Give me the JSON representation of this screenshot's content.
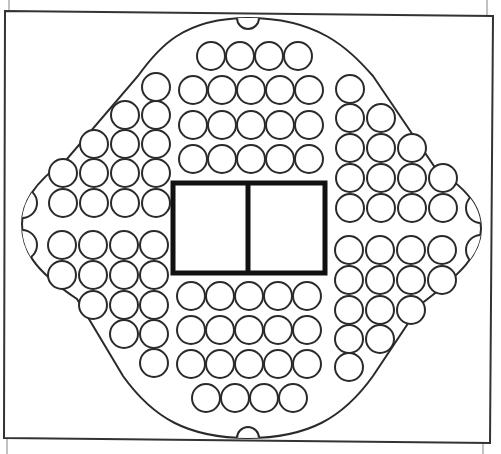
{
  "game": {
    "title": "Peg board game board",
    "colors": {
      "line": "#2a2a2a",
      "center_box": "#111111",
      "background": "#ffffff",
      "frame": "#333333",
      "tick": "#999999"
    },
    "frame": {
      "points": [
        [
          5,
          11
        ],
        [
          493,
          16
        ],
        [
          490,
          443
        ],
        [
          4,
          438
        ]
      ]
    },
    "ticks": [
      {
        "x1": 9,
        "y1": 0,
        "x2": 9,
        "y2": 11
      },
      {
        "x1": 487,
        "y1": 0,
        "x2": 487,
        "y2": 16
      },
      {
        "x1": 7,
        "y1": 438,
        "x2": 7,
        "y2": 454
      },
      {
        "x1": 483,
        "y1": 443,
        "x2": 483,
        "y2": 454
      }
    ],
    "board_outline": {
      "top": [
        248,
        18
      ],
      "right": [
        481,
        229
      ],
      "bottom": [
        248,
        438
      ],
      "left": [
        22,
        224
      ]
    },
    "center_box": {
      "x": 173,
      "y": 183,
      "width": 152,
      "height": 90,
      "divider_x": 248,
      "compartments": [
        "left-compartment",
        "right-compartment"
      ]
    },
    "hole_radius": 14,
    "half_holes": [
      {
        "id": "top",
        "cx": 248,
        "cy": 18,
        "r": 11,
        "side": "top"
      },
      {
        "id": "bottom",
        "cx": 248,
        "cy": 438,
        "r": 11,
        "side": "bottom"
      },
      {
        "id": "left-upper",
        "cx": 22,
        "cy": 203,
        "r": 15,
        "side": "left"
      },
      {
        "id": "left-lower",
        "cx": 22,
        "cy": 245,
        "r": 15,
        "side": "left"
      },
      {
        "id": "right-upper",
        "cx": 481,
        "cy": 208,
        "r": 15,
        "side": "right"
      },
      {
        "id": "right-lower",
        "cx": 481,
        "cy": 250,
        "r": 15,
        "side": "right"
      }
    ],
    "regions": {
      "top": {
        "rows": [
          {
            "y": 56,
            "xs": [
              211,
              240,
              269,
              298
            ]
          },
          {
            "y": 90,
            "xs": [
              193,
              222,
              251,
              280,
              309
            ]
          },
          {
            "y": 125,
            "xs": [
              193,
              222,
              251,
              280,
              309
            ]
          },
          {
            "y": 159,
            "xs": [
              193,
              222,
              251,
              280,
              309
            ]
          }
        ]
      },
      "bottom": {
        "rows": [
          {
            "y": 296,
            "xs": [
              191,
              220,
              249,
              278,
              307
            ]
          },
          {
            "y": 330,
            "xs": [
              191,
              220,
              249,
              278,
              307
            ]
          },
          {
            "y": 364,
            "xs": [
              191,
              220,
              249,
              278,
              307
            ]
          },
          {
            "y": 398,
            "xs": [
              206,
              235,
              264,
              293
            ]
          }
        ]
      },
      "left_upper": {
        "cols": [
          {
            "x": 156,
            "ys": [
              87,
              115,
              144,
              173,
              203
            ]
          },
          {
            "x": 125,
            "ys": [
              115,
              144,
              173,
              203
            ]
          },
          {
            "x": 94,
            "ys": [
              144,
              173,
              203
            ]
          },
          {
            "x": 63,
            "ys": [
              173,
              203
            ]
          }
        ]
      },
      "left_lower": {
        "cols": [
          {
            "x": 154,
            "ys": [
              245,
              275,
              305,
              334,
              363
            ]
          },
          {
            "x": 124,
            "ys": [
              245,
              275,
              305,
              334
            ]
          },
          {
            "x": 93,
            "ys": [
              245,
              275,
              305
            ]
          },
          {
            "x": 62,
            "ys": [
              245,
              275
            ]
          }
        ]
      },
      "right_upper": {
        "cols": [
          {
            "x": 350,
            "ys": [
              89,
              118,
              148,
              178,
              208
            ]
          },
          {
            "x": 381,
            "ys": [
              118,
              148,
              178,
              208
            ]
          },
          {
            "x": 412,
            "ys": [
              148,
              178,
              208
            ]
          },
          {
            "x": 443,
            "ys": [
              178,
              208
            ]
          }
        ]
      },
      "right_lower": {
        "cols": [
          {
            "x": 349,
            "ys": [
              250,
              280,
              310,
              339,
              367
            ]
          },
          {
            "x": 380,
            "ys": [
              250,
              280,
              310,
              339
            ]
          },
          {
            "x": 411,
            "ys": [
              250,
              280,
              310
            ]
          },
          {
            "x": 442,
            "ys": [
              250,
              280
            ]
          }
        ]
      }
    },
    "counts": {
      "full_holes": 92,
      "half_holes": 6
    }
  }
}
